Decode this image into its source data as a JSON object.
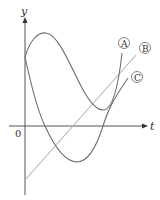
{
  "diagram": {
    "axes": {
      "x_label": "t",
      "y_label": "y",
      "origin_label": "0"
    },
    "curves": [
      {
        "id": "A",
        "label": "A",
        "color": "#6e6e6e",
        "description": "cubic-like curve starting on positive y-axis, rising to max, dipping to a local min above the t-axis, then rising"
      },
      {
        "id": "B",
        "label": "B",
        "color": "#b5b5b5",
        "description": "straight line starting below origin on y-axis, rising with positive slope"
      },
      {
        "id": "C",
        "label": "C",
        "color": "#6e6e6e",
        "description": "curve starting on positive y-axis, decreasing below t-axis to a minimum, then increasing"
      }
    ]
  }
}
